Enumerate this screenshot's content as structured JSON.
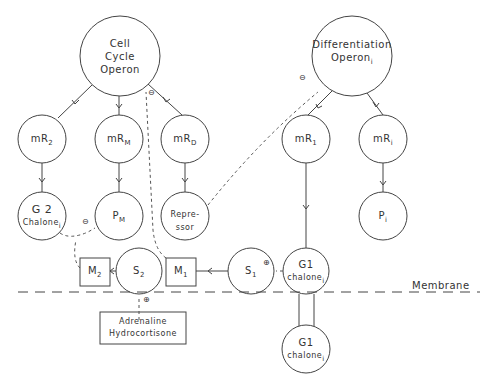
{
  "diagram": {
    "nodes": {
      "cell_cycle_operon": {
        "line1": "Cell",
        "line2": "Cycle",
        "line3": "Operon"
      },
      "differentiation_operon": {
        "line1": "Differentiation",
        "line2": "Operon",
        "sub": "i"
      },
      "mR2": {
        "main": "mR",
        "sub": "2"
      },
      "mRM": {
        "main": "mR",
        "sub": "M"
      },
      "mRD": {
        "main": "mR",
        "sub": "D"
      },
      "mR1": {
        "main": "mR",
        "sub": "1"
      },
      "mRi": {
        "main": "mR",
        "sub": "i"
      },
      "g2_chalone": {
        "line1": "G 2",
        "line2": "Chalone",
        "sub": "i"
      },
      "PM": {
        "main": "P",
        "sub": "M"
      },
      "repressor": {
        "line1": "Repre-",
        "line2": "ssor"
      },
      "Pi": {
        "main": "P",
        "sub": "i"
      },
      "M2": {
        "main": "M",
        "sub": "2"
      },
      "S2": {
        "main": "S",
        "sub": "2"
      },
      "M1": {
        "main": "M",
        "sub": "1"
      },
      "S1": {
        "main": "S",
        "sub": "1"
      },
      "g1_chalone_inner": {
        "line1": "G1",
        "line2": "chalone",
        "sub": "i"
      },
      "g1_chalone_outer": {
        "line1": "G1",
        "line2": "chalone",
        "sub": "i"
      },
      "hormones": {
        "line1": "Adrenaline",
        "line2": "Hydrocortisone"
      }
    },
    "membrane_label": "Membrane",
    "signs": {
      "minus": "⊖",
      "plus": "⊕"
    }
  }
}
